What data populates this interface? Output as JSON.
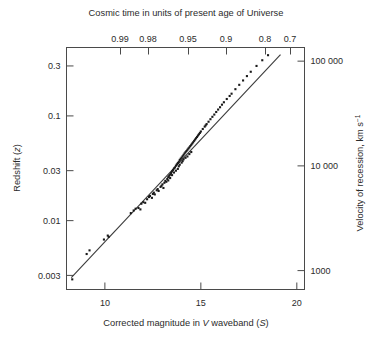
{
  "figure": {
    "title_top": "Cosmic time in units of present age of Universe",
    "xlabel_bottom_parts": {
      "a": "Corrected magnitude in ",
      "b": "V",
      "c": " waveband (",
      "d": "S",
      "e": ")"
    },
    "ylabel_left_parts": {
      "a": "Redshift (",
      "b": "z",
      "c": ")"
    },
    "ylabel_right_parts": {
      "a": "Velocity of recession, km s",
      "b": "−1"
    },
    "colors": {
      "axis": "#4a4a4a",
      "text": "#2b2b2b",
      "point": "#1a1a1a",
      "line": "#3a3a3a",
      "background": "#ffffff"
    }
  },
  "chart_data": {
    "type": "scatter",
    "title": "Cosmic time in units of present age of Universe",
    "xlabel": "Corrected magnitude in V waveband (S)",
    "ylabel": "Redshift (z)",
    "y2label": "Velocity of recession, km s−1",
    "x2label": "Cosmic time in units of present age of Universe",
    "grid": false,
    "legend": "none",
    "xscale": "linear",
    "yscale": "log",
    "xlim": [
      8.0,
      20.4
    ],
    "ylim": [
      0.0022,
      0.45
    ],
    "y2lim": [
      660,
      135000
    ],
    "xticks": [
      10,
      15,
      20
    ],
    "xticklabels": [
      "10",
      "15",
      "20"
    ],
    "yticks": [
      0.003,
      0.01,
      0.03,
      0.1,
      0.3
    ],
    "yticklabels": [
      "0.003",
      "0.01",
      "0.03",
      "0.1",
      "0.3"
    ],
    "y2ticks": [
      1000,
      10000,
      100000
    ],
    "y2ticklabels": [
      "1000",
      "10 000",
      "100 000"
    ],
    "x2ticks_positions_mag": [
      11.05,
      12.2,
      13.85,
      15.4,
      17.0,
      18.05
    ],
    "x2ticklabels": [
      "0.99",
      "0.98",
      "0.95",
      "0.9",
      "0.8",
      "0.7"
    ],
    "fit_line": {
      "x": [
        8.25,
        19.15
      ],
      "y": [
        0.00285,
        0.385
      ],
      "slope_log10_per_mag": 0.2,
      "description": "Hubble law: log z proportional to 0.2 m"
    },
    "series": [
      {
        "name": "galaxies",
        "x": [
          8.3,
          9.05,
          9.2,
          9.95,
          10.15,
          10.2,
          11.35,
          11.5,
          11.6,
          11.75,
          11.85,
          11.9,
          12.0,
          12.1,
          12.2,
          12.3,
          12.35,
          12.45,
          12.5,
          12.55,
          12.6,
          12.7,
          12.75,
          12.8,
          12.9,
          12.95,
          13.0,
          13.05,
          13.1,
          13.15,
          13.2,
          13.25,
          13.3,
          13.3,
          13.35,
          13.4,
          13.4,
          13.45,
          13.5,
          13.5,
          13.55,
          13.6,
          13.6,
          13.65,
          13.7,
          13.7,
          13.75,
          13.8,
          13.8,
          13.85,
          13.85,
          13.9,
          13.9,
          13.95,
          14.0,
          14.0,
          14.05,
          14.05,
          14.1,
          14.1,
          14.15,
          14.2,
          14.2,
          14.25,
          14.3,
          14.3,
          14.35,
          14.4,
          14.4,
          14.45,
          14.5,
          14.5,
          14.55,
          14.6,
          14.65,
          14.7,
          14.75,
          14.8,
          14.85,
          14.9,
          14.95,
          15.0,
          15.1,
          15.2,
          15.25,
          15.3,
          15.4,
          15.5,
          15.6,
          15.7,
          15.8,
          15.9,
          16.0,
          16.1,
          16.2,
          16.35,
          16.5,
          16.6,
          16.8,
          17.0,
          17.2,
          17.4,
          17.6,
          17.9,
          18.2,
          18.5
        ],
        "y": [
          0.00275,
          0.0048,
          0.0052,
          0.0066,
          0.0072,
          0.007,
          0.0118,
          0.0125,
          0.013,
          0.0132,
          0.0128,
          0.0145,
          0.015,
          0.0148,
          0.016,
          0.0168,
          0.0172,
          0.0165,
          0.018,
          0.0185,
          0.0178,
          0.0195,
          0.02,
          0.0192,
          0.021,
          0.0215,
          0.0222,
          0.0205,
          0.023,
          0.024,
          0.0235,
          0.025,
          0.026,
          0.0242,
          0.0268,
          0.0275,
          0.0255,
          0.0285,
          0.0295,
          0.0272,
          0.0305,
          0.0315,
          0.0288,
          0.0322,
          0.0335,
          0.03,
          0.0345,
          0.0355,
          0.0312,
          0.0365,
          0.033,
          0.038,
          0.0342,
          0.039,
          0.04,
          0.0358,
          0.0412,
          0.037,
          0.0425,
          0.0385,
          0.0438,
          0.045,
          0.0398,
          0.0462,
          0.0475,
          0.041,
          0.0488,
          0.05,
          0.0432,
          0.0515,
          0.053,
          0.0452,
          0.0545,
          0.056,
          0.0578,
          0.0595,
          0.0612,
          0.063,
          0.065,
          0.0668,
          0.0688,
          0.071,
          0.075,
          0.079,
          0.0812,
          0.0835,
          0.088,
          0.093,
          0.098,
          0.103,
          0.109,
          0.115,
          0.121,
          0.128,
          0.135,
          0.145,
          0.155,
          0.163,
          0.18,
          0.198,
          0.218,
          0.24,
          0.264,
          0.3,
          0.34,
          0.38
        ]
      }
    ]
  }
}
